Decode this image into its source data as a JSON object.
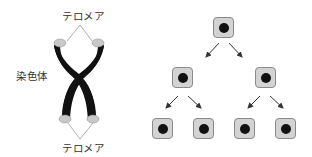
{
  "chromosome": {
    "label": "染色体",
    "telomere_top_label": "テロメア",
    "telomere_bottom_label": "テロメア",
    "colors": {
      "body": "#111111",
      "telomere": "#c8c8c8",
      "leader_line": "#999999"
    }
  },
  "cell_division": {
    "levels": [
      {
        "level": 1,
        "cells": 1
      },
      {
        "level": 2,
        "cells": 2
      },
      {
        "level": 3,
        "cells": 4
      }
    ],
    "colors": {
      "cell_fill": "#d3d3d3",
      "cell_border": "#8a8a8a",
      "nucleus": "#111111",
      "arrow": "#333333"
    }
  }
}
